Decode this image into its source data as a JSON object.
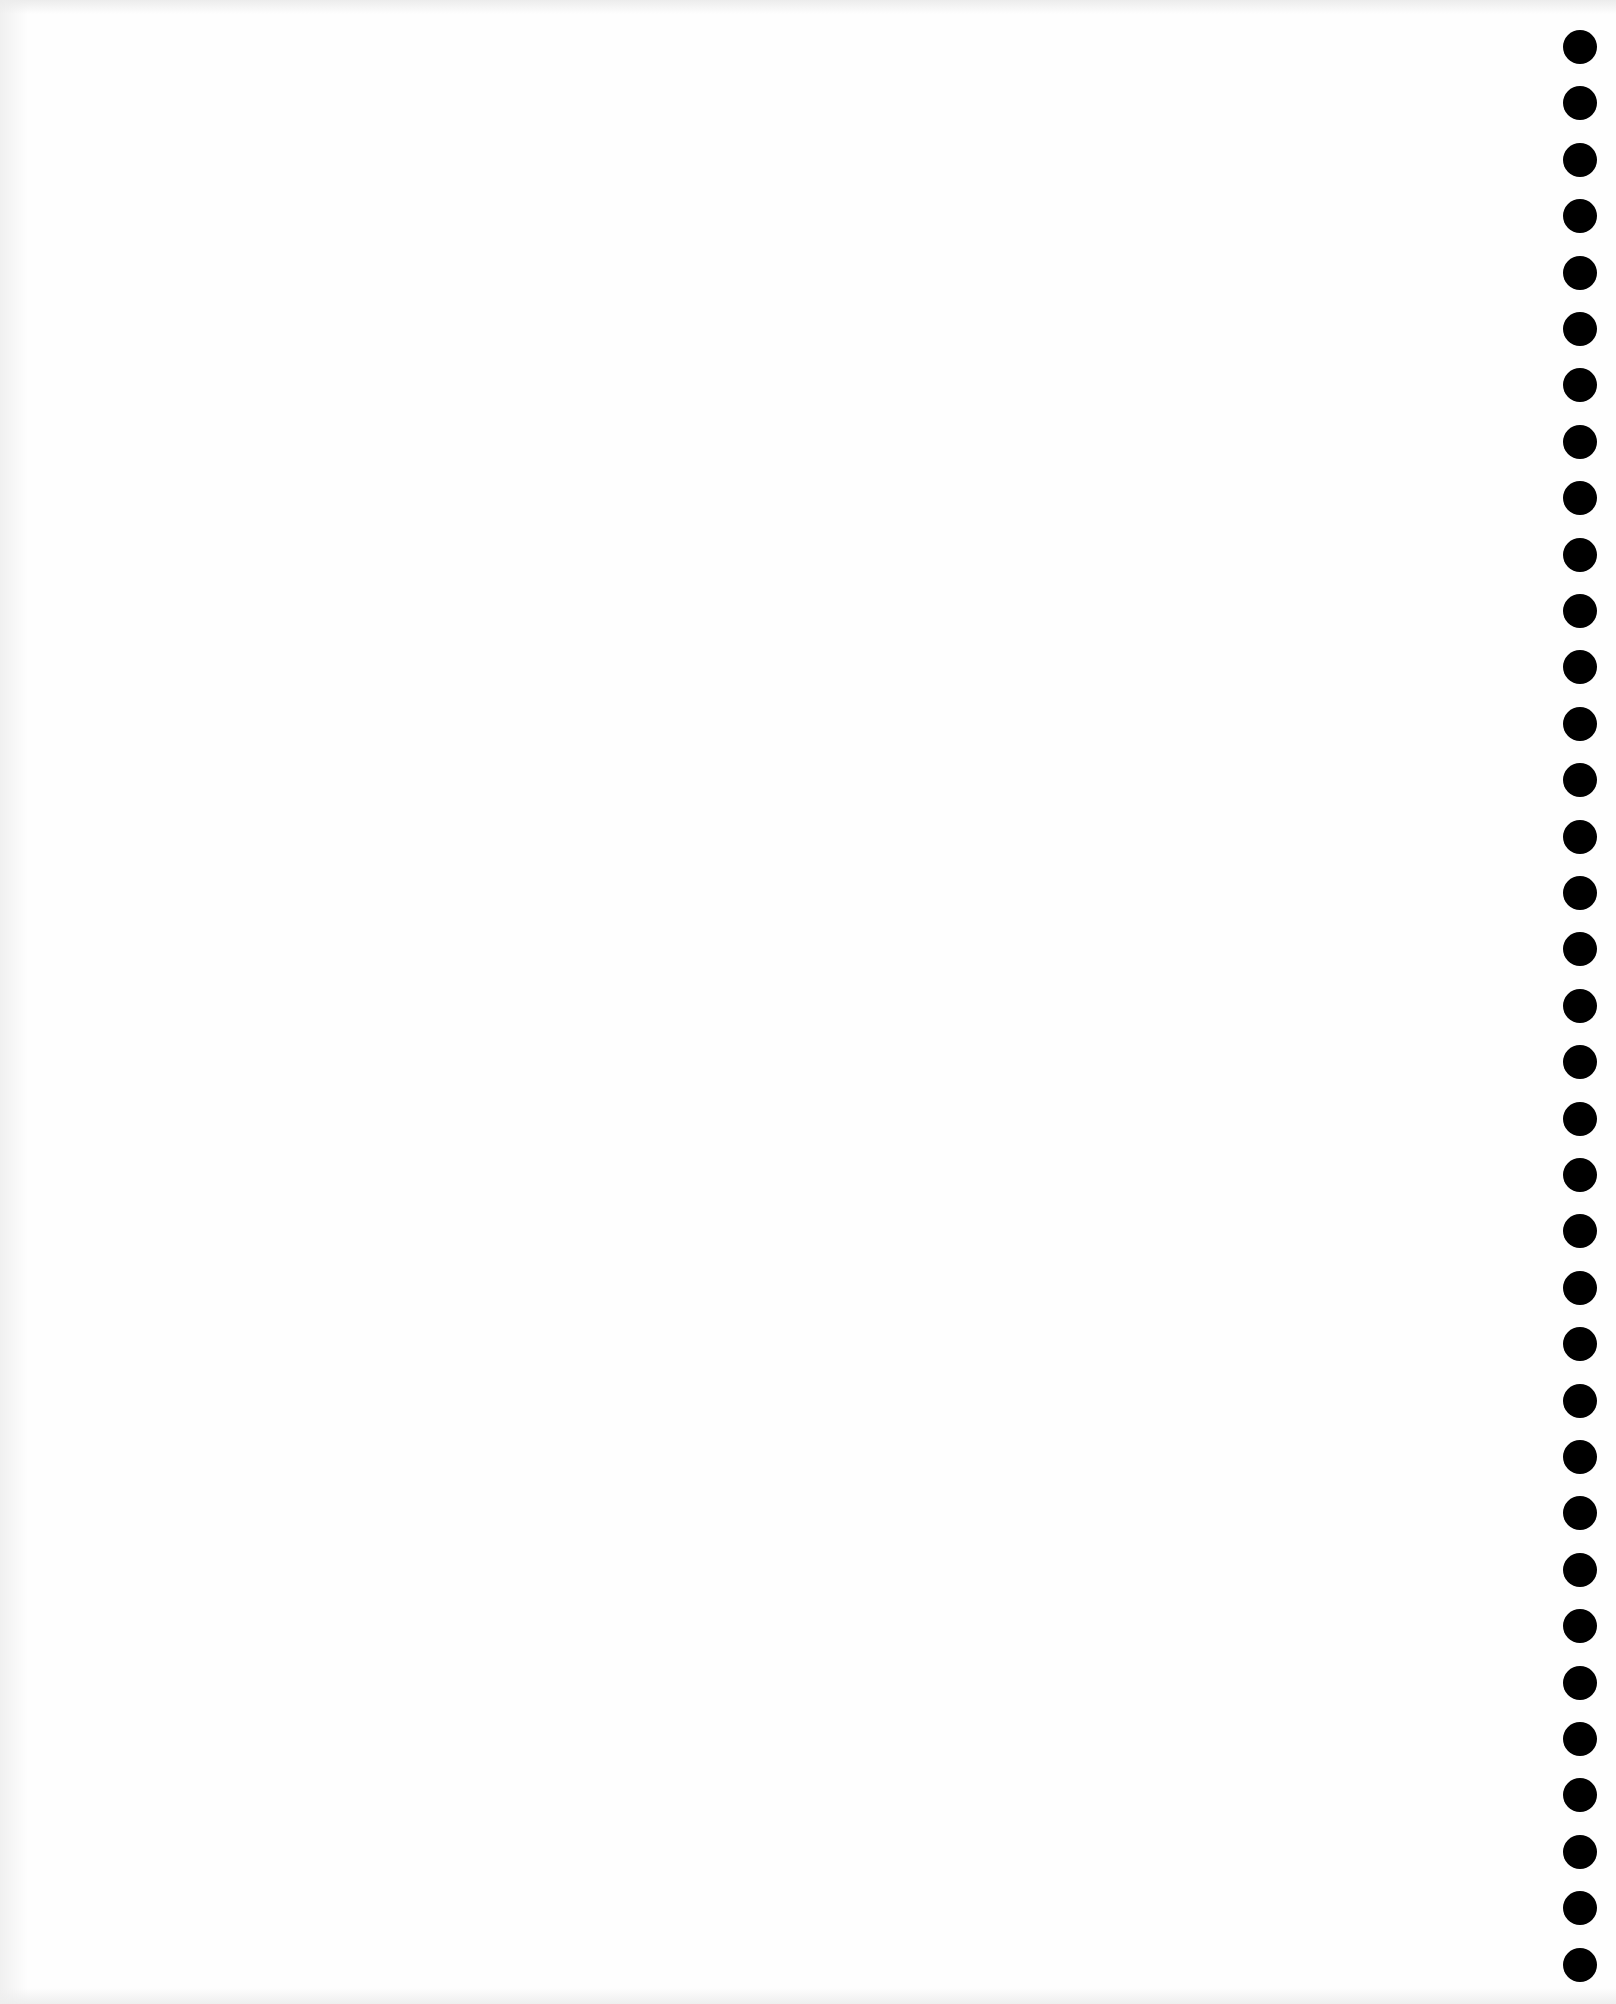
{
  "page": {
    "type": "blank-notebook-page",
    "background_color": "#fefefe",
    "text_content": ""
  },
  "binding": {
    "side": "right",
    "hole_color": "#000000",
    "hole_count": 35,
    "hole_diameter_px": 34,
    "first_hole_center_y": 47,
    "hole_spacing_px": 56.4
  }
}
